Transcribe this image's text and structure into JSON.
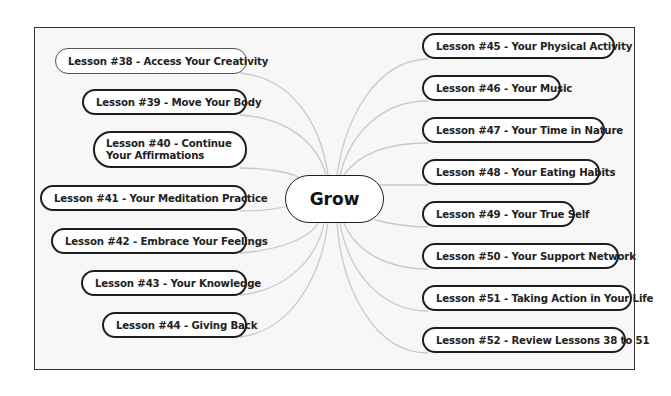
{
  "diagram": {
    "type": "mind-map",
    "central_topic": "Grow",
    "colors": {
      "background": "#ffffff",
      "canvas": "#f7f7f7",
      "frame_border": "#333333",
      "node_border": "#1e1e1e",
      "connector": "#c9c9c9",
      "text": "#222222"
    },
    "left_branches": [
      {
        "label": "Lesson #38 - Access Your Creativity"
      },
      {
        "label": "Lesson #39 - Move Your Body"
      },
      {
        "label": "Lesson #40 - Continue Your Affirmations"
      },
      {
        "label": "Lesson #41 - Your Meditation Practice"
      },
      {
        "label": "Lesson #42 - Embrace Your Feelings"
      },
      {
        "label": "Lesson #43 - Your Knowledge"
      },
      {
        "label": "Lesson #44 - Giving Back"
      }
    ],
    "right_branches": [
      {
        "label": "Lesson #45 - Your Physical Activity"
      },
      {
        "label": "Lesson #46 - Your Music"
      },
      {
        "label": "Lesson #47 - Your Time in Nature"
      },
      {
        "label": "Lesson #48 - Your Eating Habits"
      },
      {
        "label": "Lesson #49 - Your True Self"
      },
      {
        "label": "Lesson #50 - Your Support Network"
      },
      {
        "label": "Lesson #51 - Taking Action in Your Life"
      },
      {
        "label": "Lesson #52 - Review Lessons 38 to 51"
      }
    ]
  }
}
